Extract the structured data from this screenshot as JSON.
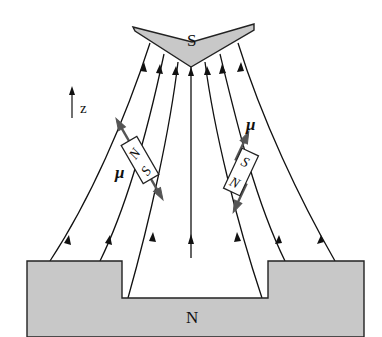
{
  "figure": {
    "labels": {
      "south_pole": "S",
      "north_pole": "N",
      "axis": "z",
      "mu_left": "μ",
      "mu_right": "μ",
      "dipole_left_top": "N",
      "dipole_left_bottom": "S",
      "dipole_right_top": "S",
      "dipole_right_bottom": "N"
    },
    "colors": {
      "pole_fill": "#c8c8c8",
      "line": "#111111",
      "dipole_arrow": "#555555",
      "background": "#ffffff"
    },
    "field_line_count": 9,
    "field_direction": "upward from N to S"
  }
}
